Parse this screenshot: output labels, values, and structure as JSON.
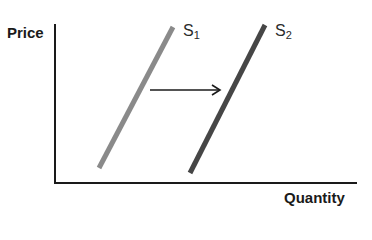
{
  "chart_data": {
    "type": "line",
    "title": "",
    "xlabel": "Quantity",
    "ylabel": "Price",
    "grid": false,
    "legend": "none",
    "series": [
      {
        "name": "S1",
        "label_main": "S",
        "label_sub": "1",
        "color": "#8a8a8a",
        "points": [
          [
            99,
            168
          ],
          [
            173,
            27
          ]
        ]
      },
      {
        "name": "S2",
        "label_main": "S",
        "label_sub": "2",
        "color": "#464646",
        "points": [
          [
            190,
            173
          ],
          [
            265,
            25
          ]
        ]
      }
    ],
    "annotations": [
      {
        "type": "arrow",
        "from": [
          150,
          90
        ],
        "to": [
          220,
          90
        ],
        "meaning": "shift right"
      }
    ]
  },
  "axes": {
    "y_label": "Price",
    "x_label": "Quantity",
    "color": "#1a1a1a"
  },
  "curves": {
    "s1": {
      "main": "S",
      "sub": "1"
    },
    "s2": {
      "main": "S",
      "sub": "2"
    }
  }
}
